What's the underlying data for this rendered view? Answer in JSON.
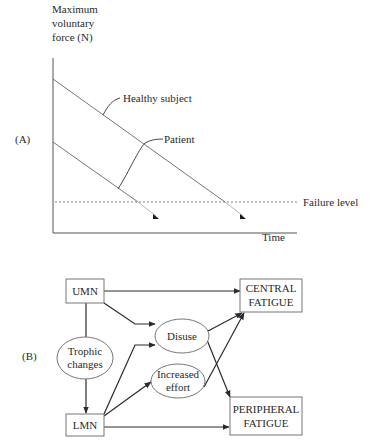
{
  "panel_a": {
    "label": "(A)",
    "y_axis_label": [
      "Maximum",
      "voluntary",
      "force (N)"
    ],
    "x_axis_label": "Time",
    "threshold_label": "Failure level",
    "series": [
      {
        "name": "Healthy subject",
        "annotation": "Healthy subject"
      },
      {
        "name": "Patient",
        "annotation": "Patient"
      }
    ]
  },
  "panel_b": {
    "label": "(B)",
    "nodes": {
      "umn": "UMN",
      "lmn": "LMN",
      "trophic": [
        "Trophic",
        "changes"
      ],
      "disuse": "Disuse",
      "effort": [
        "Increased",
        "effort"
      ],
      "central": [
        "CENTRAL",
        "FATIGUE"
      ],
      "peripheral": [
        "PERIPHERAL",
        "FATIGUE"
      ]
    },
    "edges": [
      {
        "from": "UMN",
        "to": "CENTRAL FATIGUE"
      },
      {
        "from": "UMN",
        "to": "Disuse"
      },
      {
        "from": "UMN",
        "to": "LMN",
        "via": "Trophic changes"
      },
      {
        "from": "LMN",
        "to": "Disuse"
      },
      {
        "from": "LMN",
        "to": "Increased effort"
      },
      {
        "from": "LMN",
        "to": "PERIPHERAL FATIGUE"
      },
      {
        "from": "Disuse",
        "to": "CENTRAL FATIGUE"
      },
      {
        "from": "Disuse",
        "to": "PERIPHERAL FATIGUE"
      },
      {
        "from": "Increased effort",
        "to": "CENTRAL FATIGUE"
      }
    ]
  },
  "colors": {
    "ink": "#2a2a2a",
    "line": "#555555",
    "background": "#ffffff"
  }
}
